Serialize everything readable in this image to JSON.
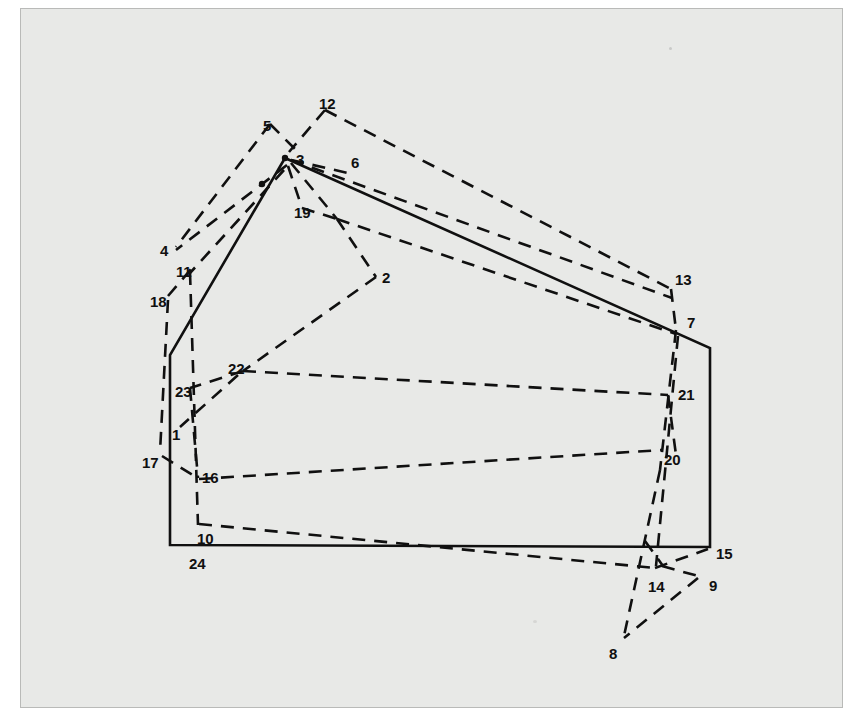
{
  "figure": {
    "kind": "scanned-technical-diagram",
    "background_color": "#e8e9e7",
    "frame_color": "#b9bab8",
    "ink_color": "#101010",
    "page_color": "#ffffff"
  },
  "style": {
    "solid_stroke_width": 2.6,
    "dashed_stroke_width": 2.6,
    "dash_pattern": "13 9",
    "dash_pattern_short": "11 8"
  },
  "boundary": {
    "name": "solid-boundary-polygon",
    "stroke": "#101010",
    "points": "285,158 710,348 710,547 170,545 170,355"
  },
  "nodes": [
    {
      "id": "1",
      "label": "1",
      "x": 178,
      "y": 428,
      "lx": 172,
      "ly": 427
    },
    {
      "id": "2",
      "label": "2",
      "x": 374,
      "y": 280,
      "lx": 382,
      "ly": 270
    },
    {
      "id": "3",
      "label": "3",
      "x": 285,
      "y": 158,
      "lx": 296,
      "ly": 152
    },
    {
      "id": "4",
      "label": "4",
      "x": 178,
      "y": 249,
      "lx": 160,
      "ly": 243
    },
    {
      "id": "5",
      "label": "5",
      "x": 274,
      "y": 131,
      "lx": 263,
      "ly": 118
    },
    {
      "id": "6",
      "label": "6",
      "x": 348,
      "y": 165,
      "lx": 351,
      "ly": 155
    },
    {
      "id": "7",
      "label": "7",
      "x": 678,
      "y": 327,
      "lx": 687,
      "ly": 315
    },
    {
      "id": "8",
      "label": "8",
      "x": 622,
      "y": 640,
      "lx": 609,
      "ly": 646
    },
    {
      "id": "9",
      "label": "9",
      "x": 700,
      "y": 578,
      "lx": 709,
      "ly": 578
    },
    {
      "id": "10",
      "label": "10",
      "x": 196,
      "y": 522,
      "lx": 197,
      "ly": 531
    },
    {
      "id": "11",
      "label": "11",
      "x": 192,
      "y": 272,
      "lx": 176,
      "ly": 264
    },
    {
      "id": "12",
      "label": "12",
      "x": 325,
      "y": 110,
      "lx": 319,
      "ly": 96
    },
    {
      "id": "13",
      "label": "13",
      "x": 672,
      "y": 283,
      "lx": 675,
      "ly": 272
    },
    {
      "id": "14",
      "label": "14",
      "x": 655,
      "y": 568,
      "lx": 648,
      "ly": 579
    },
    {
      "id": "15",
      "label": "15",
      "x": 710,
      "y": 547,
      "lx": 716,
      "ly": 546
    },
    {
      "id": "16",
      "label": "16",
      "x": 198,
      "y": 478,
      "lx": 202,
      "ly": 470
    },
    {
      "id": "17",
      "label": "17",
      "x": 160,
      "y": 455,
      "lx": 142,
      "ly": 455
    },
    {
      "id": "18",
      "label": "18",
      "x": 172,
      "y": 300,
      "lx": 150,
      "ly": 294
    },
    {
      "id": "19",
      "label": "19",
      "x": 305,
      "y": 213,
      "lx": 294,
      "ly": 205
    },
    {
      "id": "20",
      "label": "20",
      "x": 665,
      "y": 443,
      "lx": 664,
      "ly": 452
    },
    {
      "id": "21",
      "label": "21",
      "x": 668,
      "y": 392,
      "lx": 678,
      "ly": 387
    },
    {
      "id": "22",
      "label": "22",
      "x": 243,
      "y": 371,
      "lx": 228,
      "ly": 361
    },
    {
      "id": "23",
      "label": "23",
      "x": 188,
      "y": 390,
      "lx": 175,
      "ly": 384
    },
    {
      "id": "24",
      "label": "24",
      "x": 193,
      "y": 546,
      "lx": 189,
      "ly": 556
    }
  ],
  "dashed_paths": [
    {
      "name": "path-12-3",
      "d": "M 325,110 L 289,152"
    },
    {
      "name": "path-12-13",
      "d": "M 325,110 L 671,289"
    },
    {
      "name": "path-5-3",
      "d": "M 270,124 L 296,150"
    },
    {
      "name": "path-5-4",
      "d": "M 270,124 L 176,247"
    },
    {
      "name": "path-3-6-13",
      "d": "M 291,160 L 672,298"
    },
    {
      "name": "path-6-spur",
      "d": "M 291,160 L 348,173"
    },
    {
      "name": "path-3-4",
      "d": "M 287,165 L 176,250"
    },
    {
      "name": "path-3-11",
      "d": "M 284,170 L 190,273"
    },
    {
      "name": "path-3-19",
      "d": "M 288,166 L 302,208"
    },
    {
      "name": "path-19-junction",
      "d": "M 302,208 L 337,219"
    },
    {
      "name": "path-3-junction",
      "d": "M 291,163 L 337,219"
    },
    {
      "name": "path-junction-7",
      "d": "M 337,219 L 676,334"
    },
    {
      "name": "path-junction-2",
      "d": "M 337,219 L 376,277"
    },
    {
      "name": "path-2-22",
      "d": "M 376,277 L 243,371"
    },
    {
      "name": "path-22-21",
      "d": "M 243,371 L 668,395"
    },
    {
      "name": "path-22-23",
      "d": "M 243,371 L 190,388"
    },
    {
      "name": "path-22-1",
      "d": "M 238,375 L 180,427"
    },
    {
      "name": "path-18-11",
      "d": "M 168,296 L 192,268"
    },
    {
      "name": "path-18-17",
      "d": "M 168,300 L 160,452"
    },
    {
      "name": "path-11-1-10",
      "d": "M 190,272 L 198,525"
    },
    {
      "name": "path-23-16",
      "d": "M 190,388 L 198,478"
    },
    {
      "name": "path-17-16",
      "d": "M 162,456 L 199,479"
    },
    {
      "name": "path-16-20",
      "d": "M 199,479 L 662,450"
    },
    {
      "name": "path-10-14",
      "d": "M 199,524 L 655,568"
    },
    {
      "name": "path-13-7",
      "d": "M 671,289 L 676,330"
    },
    {
      "name": "path-7-21-20",
      "d": "M 676,330 L 660,470"
    },
    {
      "name": "path-7-14",
      "d": "M 678,336 L 656,566"
    },
    {
      "name": "path-21-9",
      "d": "M 668,395 L 676,455"
    },
    {
      "name": "path-20-8",
      "d": "M 660,470 L 624,636"
    },
    {
      "name": "path-14-15",
      "d": "M 655,568 L 708,549"
    },
    {
      "name": "path-14-9",
      "d": "M 662,566 L 698,576"
    },
    {
      "name": "path-9-8",
      "d": "M 698,578 L 624,638"
    },
    {
      "name": "path-20-14-b",
      "d": "M 645,541 L 663,566"
    }
  ]
}
